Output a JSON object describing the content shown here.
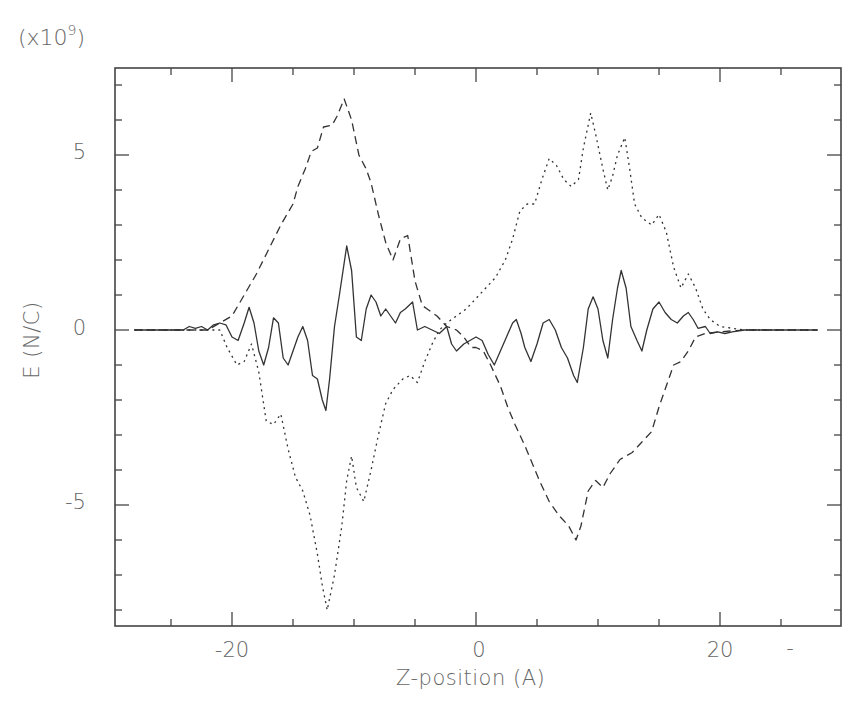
{
  "chart_data": {
    "type": "line",
    "title": "",
    "xlabel": "Z-position (A)",
    "ylabel": "E (N/C)",
    "y_scale_label": "(x10",
    "y_scale_exponent": "9",
    "y_scale_suffix": ")",
    "xlim": [
      -30,
      30
    ],
    "ylim": [
      -8.5,
      7.5
    ],
    "x_ticks_major": [
      -20,
      0,
      20
    ],
    "x_tick_labels": [
      "-20",
      "0",
      "20",
      "-"
    ],
    "x_ticks_minor_step": 5,
    "y_ticks_major": [
      -5,
      0,
      5
    ],
    "y_tick_labels": [
      "5",
      "0",
      "-5"
    ],
    "y_ticks_minor_step": 1,
    "grid": false,
    "legend": null,
    "series": [
      {
        "name": "solid",
        "style": "solid",
        "points": [
          [
            -28,
            0
          ],
          [
            -24,
            0
          ],
          [
            -23.5,
            0.1
          ],
          [
            -23,
            0.05
          ],
          [
            -22.5,
            0.1
          ],
          [
            -22,
            0
          ],
          [
            -21.5,
            0.15
          ],
          [
            -21,
            0.2
          ],
          [
            -20.5,
            0.15
          ],
          [
            -20,
            -0.2
          ],
          [
            -19.5,
            -0.3
          ],
          [
            -19,
            0.2
          ],
          [
            -18.6,
            0.65
          ],
          [
            -18.2,
            0.2
          ],
          [
            -17.8,
            -0.6
          ],
          [
            -17.4,
            -1.0
          ],
          [
            -17,
            -0.5
          ],
          [
            -16.6,
            0.35
          ],
          [
            -16.2,
            0.2
          ],
          [
            -15.8,
            -0.8
          ],
          [
            -15.4,
            -1.0
          ],
          [
            -15,
            -0.6
          ],
          [
            -14.6,
            -0.2
          ],
          [
            -14.2,
            0.1
          ],
          [
            -13.8,
            -0.3
          ],
          [
            -13.4,
            -1.3
          ],
          [
            -13,
            -1.4
          ],
          [
            -12.6,
            -2.0
          ],
          [
            -12.3,
            -2.3
          ],
          [
            -12,
            -1.4
          ],
          [
            -11.6,
            0.1
          ],
          [
            -11.2,
            1.0
          ],
          [
            -10.6,
            2.4
          ],
          [
            -10.2,
            1.7
          ],
          [
            -9.8,
            -0.2
          ],
          [
            -9.4,
            -0.3
          ],
          [
            -9,
            0.6
          ],
          [
            -8.6,
            1.0
          ],
          [
            -8.2,
            0.8
          ],
          [
            -7.8,
            0.4
          ],
          [
            -7.4,
            0.6
          ],
          [
            -7,
            0.4
          ],
          [
            -6.6,
            0.2
          ],
          [
            -6.2,
            0.5
          ],
          [
            -5.8,
            0.6
          ],
          [
            -5.2,
            0.8
          ],
          [
            -4.8,
            0.0
          ],
          [
            -4.2,
            0.1
          ],
          [
            -3.6,
            -0.0
          ],
          [
            -3,
            -0.1
          ],
          [
            -2.4,
            0.1
          ],
          [
            -2,
            -0.4
          ],
          [
            -1.6,
            -0.6
          ],
          [
            -1,
            -0.4
          ],
          [
            -0.5,
            -0.3
          ],
          [
            0,
            -0.2
          ],
          [
            0.5,
            -0.3
          ],
          [
            1,
            -0.7
          ],
          [
            1.5,
            -1.0
          ],
          [
            2,
            -0.6
          ],
          [
            2.5,
            -0.2
          ],
          [
            3,
            0.2
          ],
          [
            3.3,
            0.3
          ],
          [
            3.7,
            -0.1
          ],
          [
            4,
            -0.5
          ],
          [
            4.5,
            -0.9
          ],
          [
            5,
            -0.4
          ],
          [
            5.5,
            0.2
          ],
          [
            6,
            0.3
          ],
          [
            6.5,
            0.0
          ],
          [
            7,
            -0.5
          ],
          [
            7.5,
            -0.8
          ],
          [
            8,
            -1.3
          ],
          [
            8.3,
            -1.5
          ],
          [
            8.8,
            -0.5
          ],
          [
            9.2,
            0.6
          ],
          [
            9.6,
            0.95
          ],
          [
            10,
            0.6
          ],
          [
            10.4,
            -0.3
          ],
          [
            10.8,
            -0.8
          ],
          [
            11.2,
            0.3
          ],
          [
            11.6,
            1.2
          ],
          [
            11.9,
            1.7
          ],
          [
            12.3,
            1.2
          ],
          [
            12.7,
            0.1
          ],
          [
            13.2,
            -0.3
          ],
          [
            13.6,
            -0.6
          ],
          [
            14,
            0.0
          ],
          [
            14.5,
            0.6
          ],
          [
            15,
            0.8
          ],
          [
            15.5,
            0.5
          ],
          [
            16,
            0.3
          ],
          [
            16.5,
            0.2
          ],
          [
            17,
            0.4
          ],
          [
            17.4,
            0.5
          ],
          [
            17.8,
            0.3
          ],
          [
            18.2,
            0.05
          ],
          [
            18.8,
            0.1
          ],
          [
            19.2,
            -0.1
          ],
          [
            19.8,
            -0.05
          ],
          [
            20.4,
            -0.1
          ],
          [
            21,
            -0.05
          ],
          [
            22,
            0
          ],
          [
            28,
            0
          ]
        ]
      },
      {
        "name": "dashed",
        "style": "dashed",
        "points": [
          [
            -28,
            0
          ],
          [
            -22,
            0.0
          ],
          [
            -21,
            0.2
          ],
          [
            -20,
            0.4
          ],
          [
            -19,
            1.0
          ],
          [
            -18,
            1.6
          ],
          [
            -17,
            2.3
          ],
          [
            -16,
            3.0
          ],
          [
            -15,
            3.6
          ],
          [
            -14.6,
            4.1
          ],
          [
            -14,
            4.6
          ],
          [
            -13.5,
            5.1
          ],
          [
            -13,
            5.2
          ],
          [
            -12.5,
            5.8
          ],
          [
            -11.8,
            5.85
          ],
          [
            -11.4,
            6.1
          ],
          [
            -10.8,
            6.6
          ],
          [
            -10.2,
            6.0
          ],
          [
            -9.6,
            5.0
          ],
          [
            -9,
            4.6
          ],
          [
            -8.6,
            4.2
          ],
          [
            -8,
            3.3
          ],
          [
            -7.4,
            2.5
          ],
          [
            -6.8,
            2.0
          ],
          [
            -6.2,
            2.6
          ],
          [
            -5.6,
            2.7
          ],
          [
            -5,
            1.4
          ],
          [
            -4.4,
            0.7
          ],
          [
            -4,
            0.6
          ],
          [
            -3.2,
            0.4
          ],
          [
            -2.4,
            0.1
          ],
          [
            -1.6,
            0
          ],
          [
            -1,
            -0.2
          ],
          [
            -0.4,
            -0.5
          ],
          [
            0,
            -0.5
          ],
          [
            0.6,
            -0.6
          ],
          [
            1.2,
            -1.0
          ],
          [
            2,
            -1.6
          ],
          [
            2.6,
            -2.2
          ],
          [
            3.2,
            -2.7
          ],
          [
            4,
            -3.3
          ],
          [
            4.6,
            -3.8
          ],
          [
            5.2,
            -4.3
          ],
          [
            6,
            -4.9
          ],
          [
            6.8,
            -5.3
          ],
          [
            7.6,
            -5.6
          ],
          [
            8.2,
            -6.0
          ],
          [
            8.6,
            -5.6
          ],
          [
            9.2,
            -4.6
          ],
          [
            9.8,
            -4.3
          ],
          [
            10.4,
            -4.5
          ],
          [
            11,
            -4.1
          ],
          [
            11.8,
            -3.7
          ],
          [
            12.8,
            -3.5
          ],
          [
            13.6,
            -3.2
          ],
          [
            14.4,
            -2.9
          ],
          [
            15,
            -2.2
          ],
          [
            15.6,
            -1.6
          ],
          [
            16.2,
            -1.0
          ],
          [
            16.8,
            -0.9
          ],
          [
            17.4,
            -0.6
          ],
          [
            18,
            -0.2
          ],
          [
            18.8,
            -0.1
          ],
          [
            20,
            -0.05
          ],
          [
            22,
            0
          ],
          [
            28,
            0
          ]
        ]
      },
      {
        "name": "dotted",
        "style": "dotted",
        "points": [
          [
            -28,
            0
          ],
          [
            -22,
            0.0
          ],
          [
            -21,
            0.0
          ],
          [
            -20.4,
            -0.5
          ],
          [
            -19.6,
            -1.0
          ],
          [
            -19,
            -0.9
          ],
          [
            -18.4,
            -0.4
          ],
          [
            -17.8,
            -1.2
          ],
          [
            -17.2,
            -2.6
          ],
          [
            -16.6,
            -2.7
          ],
          [
            -16,
            -2.4
          ],
          [
            -15.4,
            -3.4
          ],
          [
            -14.8,
            -4.2
          ],
          [
            -14.2,
            -4.6
          ],
          [
            -13.6,
            -5.3
          ],
          [
            -13,
            -6.4
          ],
          [
            -12.6,
            -7.3
          ],
          [
            -12.2,
            -8.0
          ],
          [
            -11.6,
            -7.0
          ],
          [
            -11,
            -5.6
          ],
          [
            -10.6,
            -4.3
          ],
          [
            -10.2,
            -3.6
          ],
          [
            -9.8,
            -4.5
          ],
          [
            -9.2,
            -4.9
          ],
          [
            -8.6,
            -4.0
          ],
          [
            -8,
            -3.0
          ],
          [
            -7.4,
            -2.1
          ],
          [
            -6.8,
            -1.7
          ],
          [
            -6,
            -1.4
          ],
          [
            -5.4,
            -1.3
          ],
          [
            -4.8,
            -1.5
          ],
          [
            -4.2,
            -0.9
          ],
          [
            -3.6,
            -0.4
          ],
          [
            -3,
            0.0
          ],
          [
            -2.4,
            0.2
          ],
          [
            -1.6,
            0.4
          ],
          [
            -0.8,
            0.6
          ],
          [
            0,
            0.9
          ],
          [
            0.8,
            1.2
          ],
          [
            1.6,
            1.5
          ],
          [
            2.4,
            2.0
          ],
          [
            3,
            2.6
          ],
          [
            3.6,
            3.4
          ],
          [
            4.2,
            3.6
          ],
          [
            4.8,
            3.6
          ],
          [
            5.4,
            4.3
          ],
          [
            6,
            4.9
          ],
          [
            6.6,
            4.7
          ],
          [
            7.2,
            4.3
          ],
          [
            7.8,
            4.1
          ],
          [
            8.4,
            4.3
          ],
          [
            8.8,
            5.2
          ],
          [
            9.4,
            6.2
          ],
          [
            9.8,
            5.6
          ],
          [
            10.4,
            4.6
          ],
          [
            10.8,
            4.0
          ],
          [
            11.2,
            4.4
          ],
          [
            11.6,
            5.0
          ],
          [
            12.2,
            5.5
          ],
          [
            12.6,
            4.6
          ],
          [
            13,
            3.6
          ],
          [
            13.6,
            3.2
          ],
          [
            14.4,
            3.0
          ],
          [
            15,
            3.3
          ],
          [
            15.6,
            2.8
          ],
          [
            16.2,
            1.8
          ],
          [
            16.8,
            1.2
          ],
          [
            17.4,
            1.6
          ],
          [
            18,
            1.2
          ],
          [
            18.6,
            0.6
          ],
          [
            19.2,
            0.3
          ],
          [
            20,
            0.1
          ],
          [
            21,
            0.05
          ],
          [
            22,
            0
          ],
          [
            28,
            0
          ]
        ]
      }
    ]
  }
}
